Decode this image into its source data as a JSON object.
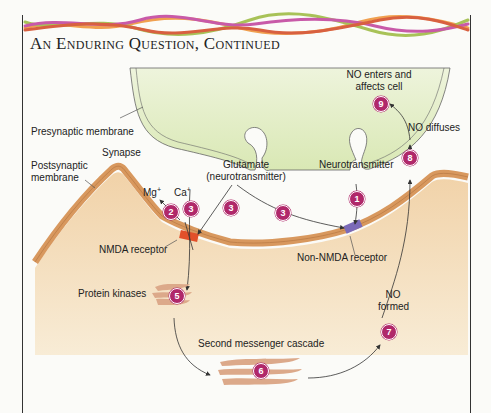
{
  "header": {
    "title": "An Enduring Question, Continued"
  },
  "colors": {
    "presynaptic_fill": "#e3edc6",
    "postsynaptic_fill": "#f3d7b3",
    "membrane_stroke": "#d8985e",
    "nmda_receptor": "#e2502a",
    "non_nmda_receptor": "#7b6ab8",
    "step_badge": "#b0286a",
    "kinase_fill": "#dca98a"
  },
  "labels": {
    "presynaptic_membrane": "Presynaptic membrane",
    "synapse": "Synapse",
    "postsynaptic_membrane_line1": "Postsynaptic",
    "postsynaptic_membrane_line2": "membrane",
    "glutamate_line1": "Glutamate",
    "glutamate_line2": "(neurotransmitter)",
    "neurotransmitter": "Neurotransmitter",
    "mg": "Mg",
    "mg_sup": "+",
    "ca": "Ca",
    "ca_sup": "+",
    "nmda_receptor": "NMDA receptor",
    "non_nmda_receptor": "Non-NMDA receptor",
    "protein_kinases": "Protein kinases",
    "second_messenger": "Second messenger cascade",
    "no_formed_line1": "NO",
    "no_formed_line2": "formed",
    "no_diffuses": "NO diffuses",
    "no_enters_line1": "NO enters and",
    "no_enters_line2": "affects cell"
  },
  "steps": [
    {
      "num": "1",
      "desc": "Neurotransmitter binds non-NMDA receptor"
    },
    {
      "num": "2",
      "desc": "Mg+ leaves NMDA receptor"
    },
    {
      "num": "3",
      "desc": "Glutamate binds receptors"
    },
    {
      "num": "4",
      "desc": "Ca+ enters via NMDA receptor"
    },
    {
      "num": "5",
      "desc": "Protein kinases activated"
    },
    {
      "num": "6",
      "desc": "Second messenger cascade"
    },
    {
      "num": "7",
      "desc": "NO formed"
    },
    {
      "num": "8",
      "desc": "NO diffuses"
    },
    {
      "num": "9",
      "desc": "NO enters and affects cell"
    }
  ]
}
